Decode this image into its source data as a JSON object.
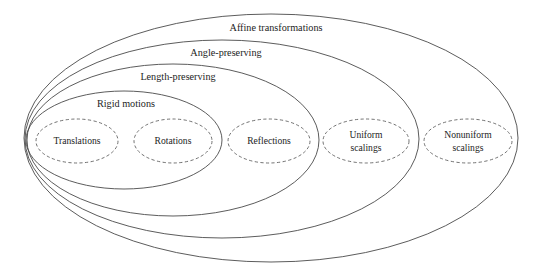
{
  "diagram": {
    "type": "nested-venn",
    "background_color": "#ffffff",
    "outline_color": "#4a4a4a",
    "leaf_outline_color": "#5a5a5a",
    "text_color": "#1d1d1d",
    "nested_sets": [
      {
        "label": "Affine transformations",
        "level": 4,
        "style": "solid",
        "cx": 271,
        "cy": 138,
        "rx": 247,
        "ry": 124,
        "label_x": 276,
        "label_y": 31
      },
      {
        "label": "Angle-preserving",
        "level": 3,
        "style": "solid",
        "cx": 222,
        "cy": 139,
        "rx": 197,
        "ry": 99,
        "label_x": 226,
        "label_y": 56
      },
      {
        "label": "Length-preserving",
        "level": 2,
        "style": "solid",
        "cx": 173,
        "cy": 140,
        "rx": 146,
        "ry": 76,
        "label_x": 178,
        "label_y": 80
      },
      {
        "label": "Rigid motions",
        "level": 1,
        "style": "solid",
        "cx": 124,
        "cy": 140,
        "rx": 98,
        "ry": 49,
        "label_x": 126,
        "label_y": 107
      }
    ],
    "leaf_sets": [
      {
        "name": "translations",
        "lines": [
          "Translations"
        ],
        "style": "dashed",
        "cx": 77,
        "cy": 141,
        "rx": 41,
        "ry": 22
      },
      {
        "name": "rotations",
        "lines": [
          "Rotations"
        ],
        "style": "dashed",
        "cx": 173,
        "cy": 141,
        "rx": 39,
        "ry": 22
      },
      {
        "name": "reflections",
        "lines": [
          "Reflections"
        ],
        "style": "dashed",
        "cx": 269,
        "cy": 141,
        "rx": 41,
        "ry": 22
      },
      {
        "name": "uniform-scalings",
        "lines": [
          "Uniform",
          "scalings"
        ],
        "style": "dashed",
        "cx": 366,
        "cy": 141,
        "rx": 43,
        "ry": 22
      },
      {
        "name": "nonuniform-scalings",
        "lines": [
          "Nonuniform",
          "scalings"
        ],
        "style": "dashed",
        "cx": 468,
        "cy": 141,
        "rx": 44,
        "ry": 22
      }
    ]
  }
}
